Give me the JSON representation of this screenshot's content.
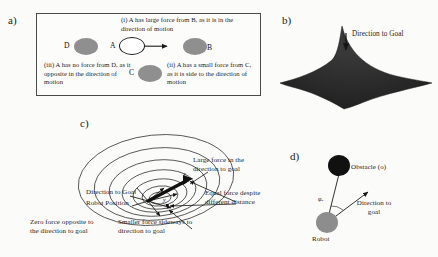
{
  "figure": {
    "background": "#fbfbfa",
    "width": 438,
    "height": 257
  },
  "panels": {
    "a": {
      "label": "a)",
      "nodes": [
        {
          "letter": "D",
          "fill": "#8f8f8f",
          "style": "filled"
        },
        {
          "letter": "A",
          "fill": "#ffffff",
          "style": "open"
        },
        {
          "letter": "B",
          "fill": "#8f8f8f",
          "style": "filled"
        },
        {
          "letter": "C",
          "fill": "#8f8f8f",
          "style": "filled"
        }
      ],
      "captions": {
        "i": "(i) A has large force from B, as it is in the direction of motion",
        "ii": "(ii) A has a small force from C, as it is side to the direction of motion",
        "iii": "(iii) A has no force from D, as it opposite in the direction of motion"
      }
    },
    "b": {
      "label": "b)",
      "annotation": "Direction to Goal",
      "surface_fill": "#2b2b2b"
    },
    "c": {
      "label": "c)",
      "annotations": {
        "direction_to_goal": "Direction to Goal",
        "robot_position": "Robot Position",
        "large_force": "Large force in the direction to goal",
        "equal_force": "Equal force despite different distance",
        "zero_force": "Zero force opposite to the direction to goal",
        "smaller_force": "Smaller force sideways to direction to goal"
      },
      "point_labels": {
        "x": "x",
        "y": "y"
      }
    },
    "d": {
      "label": "d)",
      "obstacle_label": "Obstacle (o)",
      "robot_label": "Robot",
      "goal_label": "Direction to goal",
      "angle_symbol": "φₒ",
      "obstacle_fill": "#111111",
      "robot_fill": "#8d8d8d"
    }
  }
}
